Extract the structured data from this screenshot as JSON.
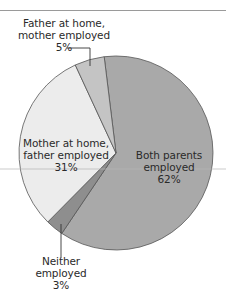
{
  "chart_data": {
    "type": "pie",
    "title": "",
    "slices": [
      {
        "label": "Both parents employed",
        "label_lines": [
          "Both parents",
          "employed",
          "62%"
        ],
        "value": 62,
        "color": "#a9a9a9"
      },
      {
        "label": "Neither employed",
        "label_lines": [
          "Neither",
          "employed",
          "3%"
        ],
        "value": 3,
        "color": "#8e8e8e"
      },
      {
        "label": "Mother at home, father employed",
        "label_lines": [
          "Mother at home,",
          "father employed",
          "31%"
        ],
        "value": 31,
        "color": "#ececec"
      },
      {
        "label": "Father at home, mother employed",
        "label_lines": [
          "Father at home,",
          "mother employed",
          "5%"
        ],
        "value": 5,
        "color": "#c4c4c4"
      }
    ],
    "units": "%",
    "legend": "none (direct labels)"
  }
}
